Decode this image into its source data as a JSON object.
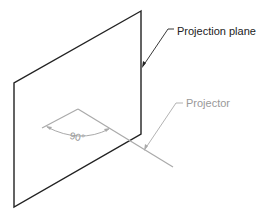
{
  "diagram": {
    "type": "orthographic-projection-illustration",
    "labels": {
      "projection_plane": "Projection plane",
      "projector": "Projector",
      "angle": "90°"
    },
    "colors": {
      "plane_stroke": "#222222",
      "projector_stroke": "#aaaaaa",
      "text_dark": "#222222",
      "text_light": "#999999",
      "background": "#ffffff"
    }
  }
}
